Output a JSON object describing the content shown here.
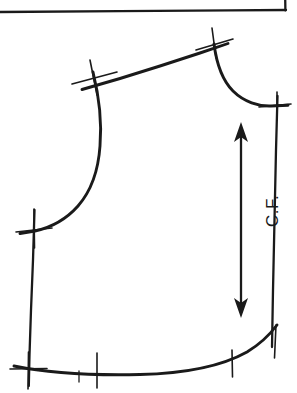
{
  "document": {
    "kind": "scanned-sewing-pattern",
    "piece_name": "bodice-front",
    "background_color": "#ffffff",
    "ink_color": "#1a1a1a"
  },
  "annotations": {
    "grainline_label": "C.F.",
    "grainline_label_rotation_deg": -90,
    "grainline_description": "double-headed arrow marking the center front grainline"
  },
  "geometry": {
    "page_border": {
      "top_rule": {
        "x1": 0,
        "y1": 11,
        "x2": 285,
        "y2": 10
      },
      "right_rule": {
        "x1": 285,
        "y1": 0,
        "x2": 285,
        "y2": 11
      }
    },
    "shoulder_seam": {
      "from_x": 85,
      "from_y": 80,
      "to_x": 220,
      "to_y": 40
    },
    "neckline_curve": "from shoulder point down and right to center front",
    "armhole_curve": "from shoulder notch curving down and left to side seam",
    "side_seam": {
      "from_x": 34,
      "from_y": 212,
      "to_x": 29,
      "to_y": 385
    },
    "center_front_line": {
      "from_x": 277,
      "from_y": 103,
      "to_x": 272,
      "to_y": 345
    },
    "hem_curve": "from bottom left rising to the right at center front"
  },
  "notches": [
    {
      "name": "shoulder-notch",
      "x": 95,
      "y": 77
    },
    {
      "name": "neck-shoulder-point-notch",
      "x": 214,
      "y": 42
    },
    {
      "name": "center-front-neck-notch",
      "x": 277,
      "y": 105
    },
    {
      "name": "underarm-notch",
      "x": 35,
      "y": 229
    },
    {
      "name": "hem-left-corner-notch",
      "x": 28,
      "y": 370
    },
    {
      "name": "hem-notch-1",
      "x": 97,
      "y": 369
    },
    {
      "name": "hem-notch-2",
      "x": 232,
      "y": 363
    },
    {
      "name": "hem-center-front-notch",
      "x": 275,
      "y": 340
    },
    {
      "name": "hem-small-tick",
      "x": 79,
      "y": 377
    }
  ],
  "grainline_arrow": {
    "x": 241,
    "top_y": 124,
    "bottom_y": 316,
    "head_length": 16,
    "head_width": 13
  }
}
